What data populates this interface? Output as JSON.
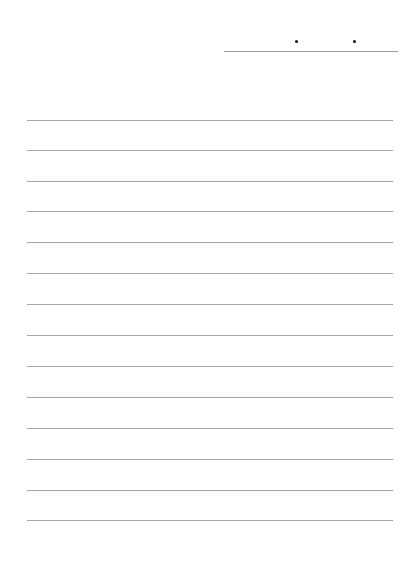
{
  "page": {
    "type": "lined-notepaper",
    "rule_color": "#a6a6a6",
    "date_field": {
      "separator": ".",
      "separator_count": 2
    },
    "lines": [
      {
        "top": 120
      },
      {
        "top": 150
      },
      {
        "top": 181
      },
      {
        "top": 211
      },
      {
        "top": 242
      },
      {
        "top": 273
      },
      {
        "top": 304
      },
      {
        "top": 335
      },
      {
        "top": 366
      },
      {
        "top": 397
      },
      {
        "top": 428
      },
      {
        "top": 459
      },
      {
        "top": 490
      },
      {
        "top": 520
      }
    ]
  }
}
